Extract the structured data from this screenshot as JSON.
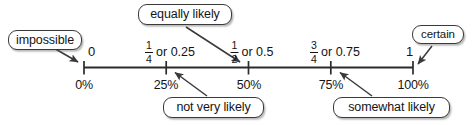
{
  "diagram": {
    "title_text": "Probability number line",
    "line": {
      "color": "#2b2b2b",
      "start_value": 0,
      "end_value": 1
    },
    "endpoints": {
      "left_numeral": "0",
      "right_numeral": "1"
    },
    "ticks": [
      {
        "position": 0,
        "top_label": "0",
        "bottom_label": "0%"
      },
      {
        "position": 0.25,
        "top_label": "1/4 or 0.25",
        "bottom_label": "25%",
        "fraction": {
          "numerator": "1",
          "denominator": "4"
        },
        "decimal_text": "or 0.25"
      },
      {
        "position": 0.5,
        "top_label": "1/2 or 0.5",
        "bottom_label": "50%",
        "fraction": {
          "numerator": "1",
          "denominator": "2"
        },
        "decimal_text": "or 0.5"
      },
      {
        "position": 0.75,
        "top_label": "3/4 or 0.75",
        "bottom_label": "75%",
        "fraction": {
          "numerator": "3",
          "denominator": "4"
        },
        "decimal_text": "or 0.75"
      },
      {
        "position": 1,
        "top_label": "1",
        "bottom_label": "100%"
      }
    ],
    "bottom_labels": {
      "p0": "0%",
      "p25": "25%",
      "p50": "50%",
      "p75": "75%",
      "p100": "100%"
    },
    "fractions": {
      "quarter": {
        "numerator": "1",
        "denominator": "4",
        "decimal_text": "or 0.25"
      },
      "half": {
        "numerator": "1",
        "denominator": "2",
        "decimal_text": "or 0.5"
      },
      "threequarter": {
        "numerator": "3",
        "denominator": "4",
        "decimal_text": "or 0.75"
      }
    },
    "callouts": [
      {
        "id": "impossible",
        "label": "impossible",
        "points_to": 0
      },
      {
        "id": "not-very-likely",
        "label": "not very likely",
        "points_to": 0.25
      },
      {
        "id": "equally-likely",
        "label": "equally likely",
        "points_to": 0.5
      },
      {
        "id": "somewhat-likely",
        "label": "somewhat likely",
        "points_to": 0.75
      },
      {
        "id": "certain",
        "label": "certain",
        "points_to": 1
      }
    ],
    "callout_labels": {
      "impossible": "impossible",
      "equally_likely": "equally likely",
      "certain": "certain",
      "not_very_likely": "not very likely",
      "somewhat_likely": "somewhat likely"
    },
    "colors": {
      "line": "#2b2b2b",
      "text": "#141414",
      "box_border": "#3a3a3a",
      "box_fill": "#ffffff",
      "arrow": "#3a3a3a",
      "background": "#ffffff"
    }
  }
}
